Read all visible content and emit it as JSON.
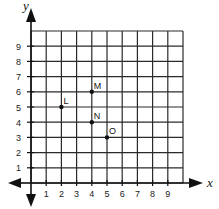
{
  "chart_data": {
    "type": "scatter",
    "title": "",
    "xlabel": "x",
    "ylabel": "y",
    "xlim": [
      0,
      10
    ],
    "ylim": [
      0,
      10
    ],
    "grid": true,
    "x_ticks": [
      "1",
      "2",
      "3",
      "4",
      "5",
      "6",
      "7",
      "8",
      "9"
    ],
    "y_ticks": [
      "1",
      "2",
      "3",
      "4",
      "5",
      "6",
      "7",
      "8",
      "9"
    ],
    "points": [
      {
        "label": "L",
        "x": 2,
        "y": 5
      },
      {
        "label": "M",
        "x": 4,
        "y": 6
      },
      {
        "label": "N",
        "x": 4,
        "y": 4
      },
      {
        "label": "O",
        "x": 5,
        "y": 3
      }
    ]
  },
  "axes": {
    "x_title": "x",
    "y_title": "y"
  }
}
